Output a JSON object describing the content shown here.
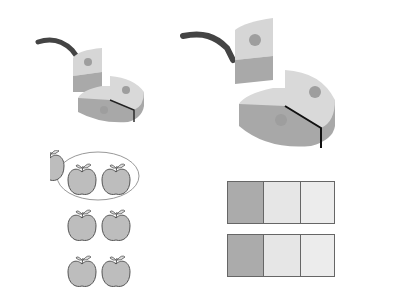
{
  "figure": {
    "small_cake": {
      "slices": 3,
      "removed": 1
    },
    "large_cake": {
      "slices": 3,
      "removed": 1
    },
    "apples": {
      "rows": 3,
      "per_row": 2,
      "circled_rows": 1
    },
    "bars": [
      {
        "parts": 3,
        "shaded": 1
      },
      {
        "parts": 3,
        "shaded": 1
      }
    ],
    "colors": {
      "cake_top": "#d9d9d9",
      "cake_side": "#a9a9a9",
      "handle": "#444444",
      "apple_fill": "#bdbdbd",
      "bar_shaded": "#ababab",
      "bar_light": "#e6e6e6",
      "outline": "#6e6e6e"
    }
  }
}
